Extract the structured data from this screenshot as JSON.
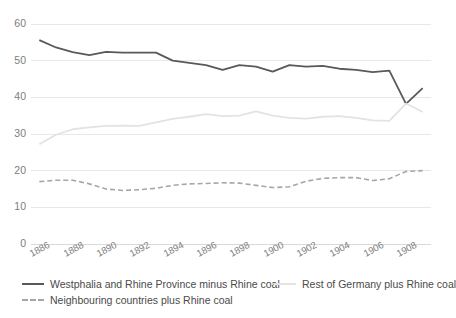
{
  "chart_data": {
    "type": "line",
    "title": "",
    "xlabel": "",
    "ylabel": "",
    "xlim": [
      1885.5,
      1909.5
    ],
    "ylim": [
      0,
      60
    ],
    "yticks": [
      0,
      10,
      20,
      30,
      40,
      50,
      60
    ],
    "grid": true,
    "legend_position": "bottom",
    "x": [
      1886,
      1887,
      1888,
      1889,
      1890,
      1891,
      1892,
      1893,
      1894,
      1895,
      1896,
      1897,
      1898,
      1899,
      1900,
      1901,
      1902,
      1903,
      1904,
      1905,
      1906,
      1907,
      1908,
      1909
    ],
    "xticks": [
      1886,
      1888,
      1890,
      1892,
      1894,
      1896,
      1898,
      1900,
      1902,
      1904,
      1906,
      1908
    ],
    "xtick_labels": [
      "1886",
      "1888",
      "1890",
      "1892",
      "1894",
      "1896",
      "1898",
      "1900",
      "1902",
      "1904",
      "1906",
      "1908"
    ],
    "series": [
      {
        "name": "Westphalia and Rhine Province minus Rhine coal",
        "color": "#595959",
        "style": "solid",
        "values": [
          55.6,
          53.6,
          52.3,
          51.5,
          52.4,
          52.2,
          52.2,
          52.2,
          50.0,
          49.4,
          48.8,
          47.5,
          48.8,
          48.4,
          47.0,
          48.8,
          48.4,
          48.6,
          47.8,
          47.5,
          46.9,
          47.3,
          38.2,
          42.5
        ]
      },
      {
        "name": "Rest of Germany plus Rhine coal",
        "color": "#e3e3e3",
        "style": "solid",
        "values": [
          27.2,
          29.8,
          31.3,
          31.8,
          32.2,
          32.3,
          32.2,
          33.2,
          34.1,
          34.7,
          35.4,
          34.9,
          35.0,
          36.2,
          35.0,
          34.4,
          34.2,
          34.7,
          34.9,
          34.4,
          33.7,
          33.6,
          38.3,
          36.0
        ]
      },
      {
        "name": "Neighbouring countries plus Rhine coal",
        "color": "#a6a6a6",
        "style": "dashed",
        "values": [
          17.0,
          17.4,
          17.4,
          16.4,
          15.0,
          14.6,
          14.8,
          15.2,
          16.0,
          16.4,
          16.5,
          16.7,
          16.6,
          16.0,
          15.4,
          15.6,
          17.1,
          17.9,
          18.1,
          18.1,
          17.3,
          17.8,
          19.8,
          20.0
        ]
      }
    ]
  },
  "legend": {
    "items": [
      {
        "label": "Westphalia and Rhine Province minus Rhine coal"
      },
      {
        "label": "Neighbouring countries plus Rhine coal"
      },
      {
        "label": "Rest of Germany plus Rhine coal"
      }
    ]
  },
  "colors": {
    "series_dark": "#595959",
    "series_light": "#e3e3e3",
    "series_dashed": "#a6a6a6",
    "grid": "#e8e8e8",
    "axis_text": "#7d7d7d",
    "legend_text": "#4a4a4a",
    "background": "#ffffff"
  }
}
